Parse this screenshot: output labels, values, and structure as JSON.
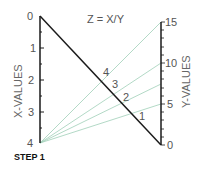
{
  "title": "Z = X/Y",
  "step_label": "STEP  1",
  "x_axis": {
    "title": "X-VALUES",
    "ticks": [
      "0",
      "1",
      "2",
      "3",
      "4"
    ]
  },
  "y_axis": {
    "title": "Y-VALUES",
    "ticks": [
      "0",
      "5",
      "10",
      "15"
    ]
  },
  "z_scale": {
    "ticks": [
      "1",
      "2",
      "3",
      "4"
    ]
  },
  "colors": {
    "axis": "#1a1a1a",
    "guide_lines": "#8fc9b0",
    "text": "#555555"
  }
}
